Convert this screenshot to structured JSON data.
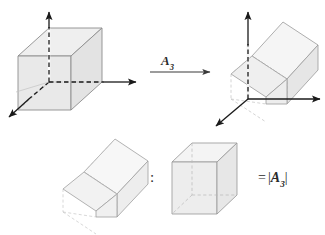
{
  "figure": {
    "transform_label": {
      "symbol": "A",
      "subscript": "3"
    },
    "ratio_separator": ":",
    "result_label": {
      "equals": "=",
      "open_bar": "|",
      "symbol": "A",
      "subscript": "3",
      "close_bar": "|"
    },
    "colors": {
      "face_fill": "#e9e9e9",
      "face_fill_light": "#f4f4f4",
      "edge": "#8d8d8d",
      "hidden_edge": "#a8a8a8",
      "axis": "#1a1a1a",
      "text": "#2b2b2b",
      "background": "#ffffff"
    },
    "top_row": {
      "source_shape": "unit-cube-with-axes",
      "target_shape": "sheared-parallelepiped-with-axes",
      "arrow": "rightwards-arrow"
    },
    "bottom_row": {
      "left_shape": "sheared-parallelepiped",
      "right_shape": "unit-cube",
      "relation": "volume ratio equals determinant magnitude"
    }
  }
}
